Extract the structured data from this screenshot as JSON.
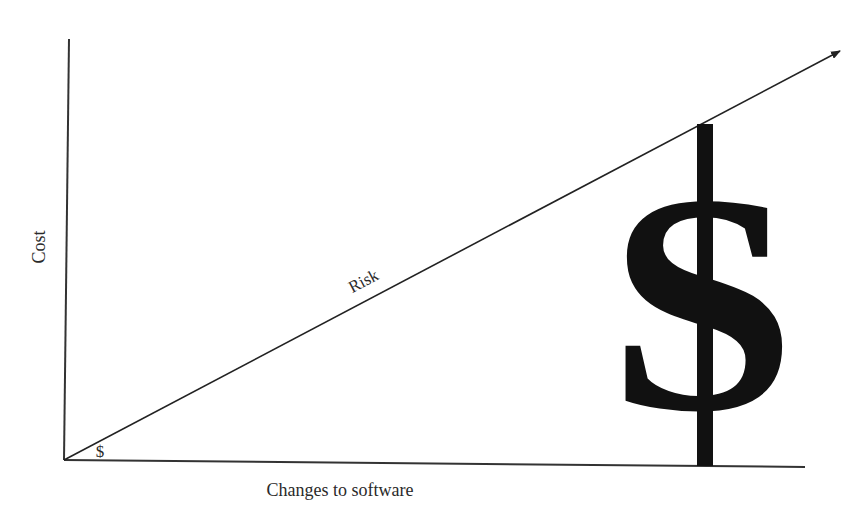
{
  "diagram": {
    "type": "cost-vs-changes concept diagram",
    "y_axis_label": "Cost",
    "x_axis_label": "Changes to software",
    "trend_line_label": "Risk",
    "small_symbol": "$",
    "large_symbol": "$",
    "colors": {
      "line": "#222222",
      "symbol": "#111111",
      "background": "#ffffff"
    }
  }
}
